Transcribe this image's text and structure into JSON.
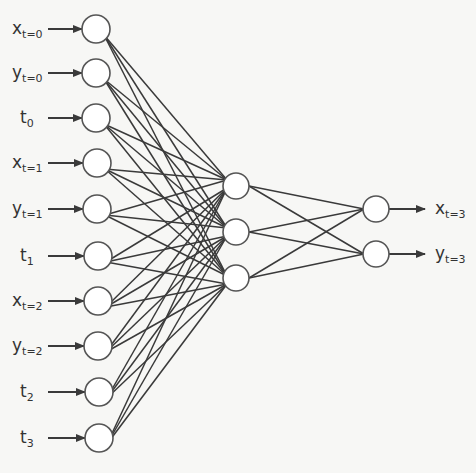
{
  "diagram": {
    "type": "neural-network",
    "colors": {
      "stroke": "#3a3a3a",
      "node_fill": "#ffffff",
      "text": "#333333",
      "background": "#f7f7f5"
    },
    "input_layer": [
      {
        "main": "x",
        "sub": "t=0"
      },
      {
        "main": "y",
        "sub": "t=0"
      },
      {
        "main": "t",
        "sub": "0"
      },
      {
        "main": "x",
        "sub": "t=1"
      },
      {
        "main": "y",
        "sub": "t=1"
      },
      {
        "main": "t",
        "sub": "1"
      },
      {
        "main": "x",
        "sub": "t=2"
      },
      {
        "main": "y",
        "sub": "t=2"
      },
      {
        "main": "t",
        "sub": "2"
      },
      {
        "main": "t",
        "sub": "3"
      }
    ],
    "hidden_layer_size": 3,
    "output_layer": [
      {
        "main": "x",
        "sub": "t=3"
      },
      {
        "main": "y",
        "sub": "t=3"
      }
    ],
    "connectivity": "fully-connected"
  }
}
